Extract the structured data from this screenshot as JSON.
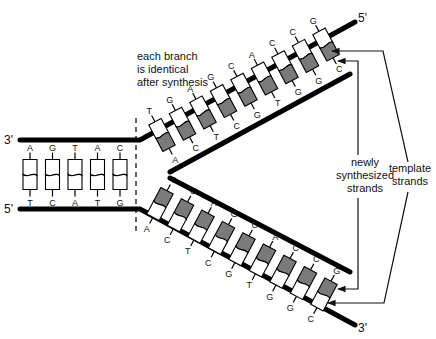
{
  "colors": {
    "strand": "#000000",
    "new_strand_fill": "#7a7a7a",
    "template_fill": "#ffffff"
  },
  "ends": {
    "parent_top": "3'",
    "parent_bottom": "5'",
    "upper_branch_end": "5'",
    "lower_branch_end": "3'"
  },
  "parent_pairs": [
    {
      "top": "A",
      "bottom": "T"
    },
    {
      "top": "G",
      "bottom": "C"
    },
    {
      "top": "T",
      "bottom": "A"
    },
    {
      "top": "A",
      "bottom": "T"
    },
    {
      "top": "C",
      "bottom": "G"
    }
  ],
  "upper_branch": {
    "template_bases": [
      "T",
      "G",
      "A",
      "G",
      "C",
      "A",
      "C",
      "C",
      "G"
    ],
    "new_bases": [
      "A",
      "C",
      "T",
      "C",
      "G",
      "T",
      "G",
      "G",
      "C"
    ]
  },
  "lower_branch": {
    "new_bases": [
      "T",
      "G",
      "A",
      "G",
      "C",
      "A",
      "C",
      "C",
      "G"
    ],
    "template_bases": [
      "A",
      "C",
      "T",
      "C",
      "G",
      "T",
      "G",
      "G",
      "C"
    ]
  },
  "annotations": {
    "branch_note": [
      "each branch",
      "is identical",
      "after synthesis"
    ],
    "new_strands": [
      "newly",
      "synthesized",
      "strands"
    ],
    "template_strands": [
      "template",
      "strands"
    ]
  }
}
